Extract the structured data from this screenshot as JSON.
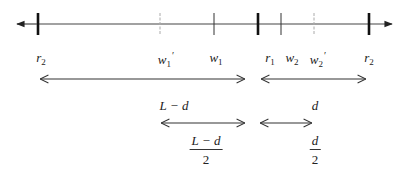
{
  "axis": {
    "y": 24,
    "x_start": 17,
    "x_end": 393,
    "color": "#333333",
    "ticks": [
      {
        "id": "r2-left",
        "x": 38,
        "style": "thick",
        "label_base": "r",
        "label_sub": "2",
        "label_prime": ""
      },
      {
        "id": "w1-prime",
        "x": 160,
        "style": "faint",
        "label_base": "w",
        "label_sub": "1",
        "label_prime": "′"
      },
      {
        "id": "w1",
        "x": 214,
        "style": "thin",
        "label_base": "w",
        "label_sub": "1",
        "label_prime": ""
      },
      {
        "id": "r1",
        "x": 258,
        "style": "thick",
        "label_base": "r",
        "label_sub": "1",
        "label_prime": ""
      },
      {
        "id": "w2",
        "x": 281,
        "style": "thin",
        "label_base": "w",
        "label_sub": "2",
        "label_prime": ""
      },
      {
        "id": "w2-prime",
        "x": 314,
        "style": "faint",
        "label_base": "w",
        "label_sub": "2",
        "label_prime": "′"
      },
      {
        "id": "r2-right",
        "x": 369,
        "style": "thick",
        "label_base": "r",
        "label_sub": "2",
        "label_prime": ""
      }
    ]
  },
  "labels": {
    "r2_left": {
      "base": "r",
      "sub": "2"
    },
    "w1_prime": {
      "base": "w",
      "sub": "1",
      "prime": "′"
    },
    "w1": {
      "base": "w",
      "sub": "1"
    },
    "r1": {
      "base": "r",
      "sub": "1"
    },
    "w2": {
      "base": "w",
      "sub": "2"
    },
    "w2_prime": {
      "base": "w",
      "sub": "2",
      "prime": "′"
    },
    "r2_right": {
      "base": "r",
      "sub": "2"
    }
  },
  "spans": {
    "row1_left": {
      "x1": 40,
      "x2": 245,
      "y": 79,
      "label": "L − d"
    },
    "row1_right": {
      "x1": 261,
      "x2": 366,
      "y": 79,
      "label": "d"
    },
    "row2_left": {
      "x1": 161,
      "x2": 245,
      "y": 123,
      "label_num": "L − d",
      "label_den": "2"
    },
    "row2_right": {
      "x1": 260,
      "x2": 312,
      "y": 123,
      "label_num": "d",
      "label_den": "2"
    }
  }
}
